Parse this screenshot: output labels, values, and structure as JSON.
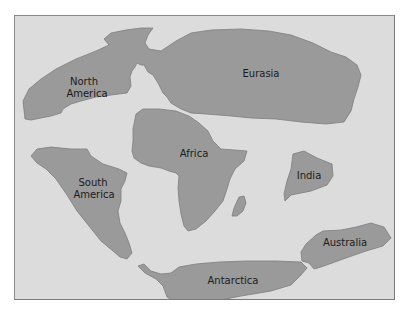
{
  "map": {
    "type": "continental-landmasses",
    "colors": {
      "ocean": "#dcdcdc",
      "land": "#9a9a9a",
      "border": "#7a7a7a",
      "label": "#1a1a1a"
    },
    "landmasses": [
      {
        "id": "north-america",
        "label_line1": "North",
        "label_line2": "America"
      },
      {
        "id": "eurasia",
        "label": "Eurasia"
      },
      {
        "id": "africa",
        "label": "Africa"
      },
      {
        "id": "south-america",
        "label_line1": "South",
        "label_line2": "America"
      },
      {
        "id": "india",
        "label": "India"
      },
      {
        "id": "australia",
        "label": "Australia"
      },
      {
        "id": "antarctica",
        "label": "Antarctica"
      },
      {
        "id": "madagascar"
      }
    ]
  }
}
